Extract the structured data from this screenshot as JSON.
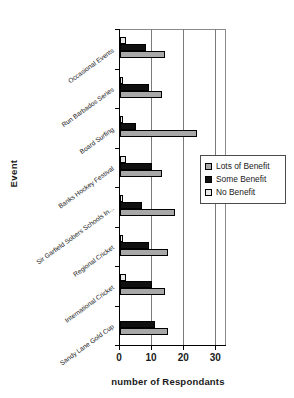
{
  "chart_data": {
    "type": "bar",
    "orientation": "horizontal",
    "title": "",
    "xlabel": "number of Respondants",
    "ylabel": "Event",
    "xlim": [
      0,
      33
    ],
    "xticks": [
      0,
      10,
      20,
      30
    ],
    "xticklabels": [
      "0",
      "10",
      "20",
      "30"
    ],
    "grid": true,
    "grid_axis": "x",
    "legend_position": "right",
    "categories": [
      "Occasional Events",
      "Run Barbados Series",
      "Board Surfing",
      "Banks Hockey Festival",
      "Sir Garfield Sobers Schools In...",
      "Regional Cricket",
      "International Cricket",
      "Sandy Lane Gold Cup"
    ],
    "series": [
      {
        "name": "Lots of Benefit",
        "color": "#a8a8a8",
        "values": [
          14,
          13,
          24,
          13,
          17,
          15,
          14,
          15
        ]
      },
      {
        "name": "Some Benefit",
        "color": "#101010",
        "values": [
          8,
          9,
          5,
          10,
          7,
          9,
          10,
          11
        ]
      },
      {
        "name": "No Benefit",
        "color": "#e8e8e8",
        "values": [
          2,
          1,
          1,
          2,
          1,
          1,
          2,
          0
        ]
      }
    ]
  },
  "legend": {
    "items": [
      {
        "label": "Lots of Benefit",
        "swatch": "#a8a8a8"
      },
      {
        "label": "Some Benefit",
        "swatch": "#101010"
      },
      {
        "label": "No Benefit",
        "swatch": "#e8e8e8"
      }
    ]
  }
}
